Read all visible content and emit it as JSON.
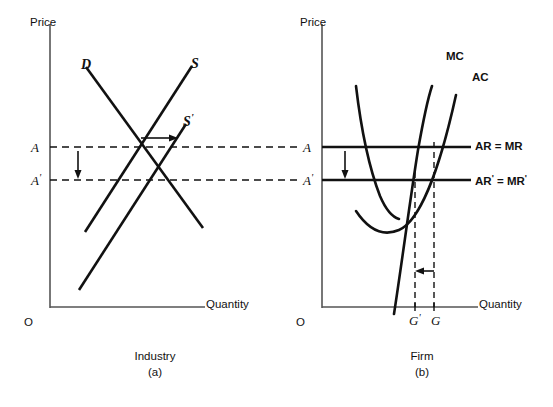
{
  "figure": {
    "panels": [
      {
        "id": "a",
        "caption_name": "Industry",
        "caption_index": "(a)",
        "y_axis_label": "Price",
        "x_axis_label": "Quantity",
        "origin_label": "O",
        "price_labels": [
          {
            "key": "A",
            "text": "A",
            "prime": ""
          },
          {
            "key": "Ap",
            "text": "A",
            "prime": "'"
          }
        ],
        "curves": [
          {
            "key": "D",
            "label": "D",
            "prime": "",
            "meaning": "demand"
          },
          {
            "key": "S",
            "label": "S",
            "prime": "",
            "meaning": "supply"
          },
          {
            "key": "Sp",
            "label": "S",
            "prime": "'",
            "meaning": "supply-shifted-right"
          }
        ],
        "annotations": [
          {
            "key": "shift-right-arrow",
            "direction": "right",
            "meaning": "supply curve shifts right"
          },
          {
            "key": "price-fall-arrow",
            "direction": "down",
            "meaning": "price falls from A to A'"
          }
        ]
      },
      {
        "id": "b",
        "caption_name": "Firm",
        "caption_index": "(b)",
        "y_axis_label": "Price",
        "x_axis_label": "Quantity",
        "origin_label": "O",
        "price_labels": [
          {
            "key": "A",
            "text": "A",
            "prime": ""
          },
          {
            "key": "Ap",
            "text": "A",
            "prime": "'"
          }
        ],
        "curves": [
          {
            "key": "MC",
            "label": "MC",
            "prime": "",
            "meaning": "marginal cost"
          },
          {
            "key": "AC",
            "label": "AC",
            "prime": "",
            "meaning": "average cost"
          }
        ],
        "revenue_lines": [
          {
            "key": "AR_MR",
            "label": "AR = MR",
            "meaning": "initial average and marginal revenue"
          },
          {
            "key": "ARp_MRp",
            "label": "AR' = MR'",
            "parts": {
              "ar": "AR",
              "eq": " = ",
              "mr": "MR"
            },
            "meaning": "new average and marginal revenue"
          }
        ],
        "quantity_labels": [
          {
            "key": "Gp",
            "text": "G",
            "prime": "'"
          },
          {
            "key": "G",
            "text": "G",
            "prime": ""
          }
        ],
        "annotations": [
          {
            "key": "price-fall-arrow",
            "direction": "down",
            "meaning": "price falls from A to A'"
          },
          {
            "key": "output-decrease-arrow",
            "direction": "left",
            "meaning": "firm output falls from G to G'"
          }
        ]
      }
    ],
    "colors": {
      "ink": "#111111",
      "axis": "#555555",
      "background": "#ffffff"
    }
  }
}
